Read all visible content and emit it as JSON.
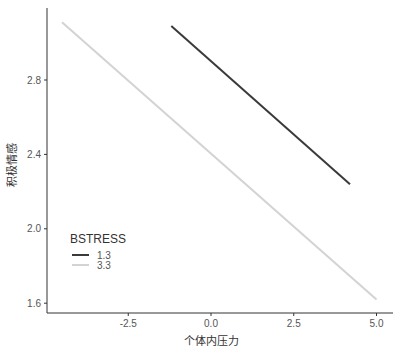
{
  "chart_data": {
    "type": "line",
    "title": "",
    "xlabel": "个体内压力",
    "ylabel": "积极情感",
    "xlim": [
      -5.0,
      5.25
    ],
    "ylim": [
      1.55,
      3.2
    ],
    "x_ticks": [
      -2.5,
      0.0,
      2.5,
      5.0
    ],
    "x_tick_labels": [
      "-2.5",
      "0.0",
      "2.5",
      "5.0"
    ],
    "y_ticks": [
      1.6,
      2.0,
      2.4,
      2.8
    ],
    "y_tick_labels": [
      "1.6",
      "2.0",
      "2.4",
      "2.8"
    ],
    "grid": false,
    "legend": {
      "title": "BSTRESS",
      "position": "inside-bottom-left"
    },
    "series": [
      {
        "name": "1.3",
        "color": "#3a3a3a",
        "x": [
          -1.2,
          4.2
        ],
        "y": [
          3.09,
          2.24
        ]
      },
      {
        "name": "3.3",
        "color": "#d3d3d3",
        "x": [
          -4.5,
          5.0
        ],
        "y": [
          3.11,
          1.62
        ]
      }
    ]
  }
}
